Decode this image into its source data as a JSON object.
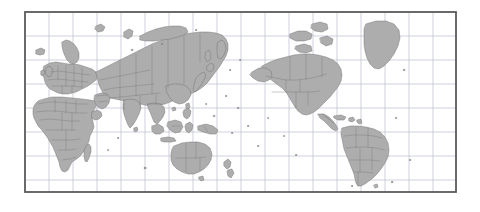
{
  "map": {
    "kind": "world-map",
    "projection": "equirectangular",
    "centering": "pacific-centered",
    "frame": {
      "x": 25,
      "y": 12,
      "width": 431,
      "height": 180,
      "border_color": "#5a5a5a",
      "border_width_px": 2
    },
    "graticule": {
      "visible": true,
      "spacing_px": 24,
      "color": "#b9bfcb",
      "vertical_lines": 17,
      "horizontal_lines": 7,
      "degree_interval": 20
    },
    "colors": {
      "page_background": "#ffffff",
      "ocean": "#ffffff",
      "land": "#adadad",
      "coastline": "#6f6f6f",
      "country_border": "#767676",
      "frame": "#5a5a5a"
    },
    "features": {
      "continents": [
        "Africa",
        "Europe",
        "Asia",
        "Australia",
        "North America",
        "South America"
      ],
      "notable_landmasses": [
        "Greenland",
        "Madagascar",
        "New Zealand",
        "Japan",
        "Indonesia",
        "British Isles",
        "Iceland",
        "Sri Lanka",
        "Philippines",
        "Papua New Guinea",
        "Cuba",
        "Taiwan",
        "Svalbard",
        "Tasmania",
        "Hainan",
        "Sakhalin",
        "Novaya Zemlya"
      ],
      "country_borders_shown": true,
      "labels_shown": false,
      "antarctica_shown": false
    }
  }
}
